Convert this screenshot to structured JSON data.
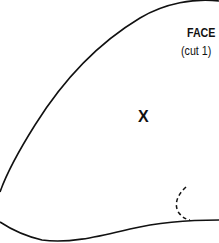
{
  "pattern_piece": {
    "title": "FACE",
    "instruction": "(cut 1)",
    "center_mark": "X",
    "outline_color": "#111111",
    "fold_mark_style": "dashed"
  }
}
